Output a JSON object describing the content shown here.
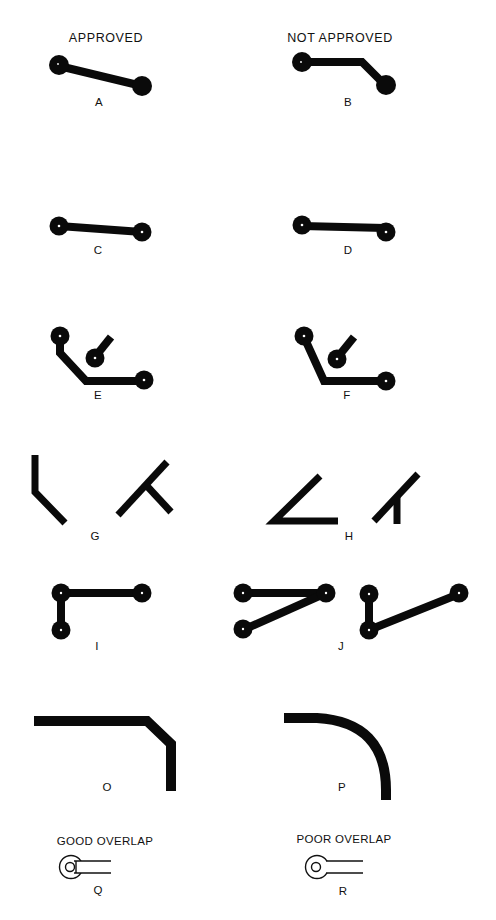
{
  "headers": {
    "left": "APPROVED",
    "right": "NOT APPROVED"
  },
  "figures": [
    {
      "id": "A",
      "label": "A",
      "column": "approved",
      "description": "straight diagonal trace between two pads"
    },
    {
      "id": "B",
      "label": "B",
      "column": "not_approved",
      "description": "trace with unnecessary bend between two pads"
    },
    {
      "id": "C",
      "label": "C",
      "column": "approved",
      "description": "trace centered on pads"
    },
    {
      "id": "D",
      "label": "D",
      "column": "not_approved",
      "description": "trace offset from pad centers"
    },
    {
      "id": "E",
      "label": "E",
      "column": "approved",
      "description": "adequate spacing between trace and pad"
    },
    {
      "id": "F",
      "label": "F",
      "column": "not_approved",
      "description": "insufficient spacing between trace and pad"
    },
    {
      "id": "G",
      "label": "G",
      "column": "approved",
      "description": "obtuse bends and 90 degree tee junctions"
    },
    {
      "id": "H",
      "label": "H",
      "column": "not_approved",
      "description": "acute angle bends and junctions"
    },
    {
      "id": "I",
      "label": "I",
      "column": "approved",
      "description": "traces joining at right angles from pad"
    },
    {
      "id": "J",
      "label": "J",
      "column": "not_approved",
      "description": "traces forming acute angle at pad"
    },
    {
      "id": "O",
      "label": "O",
      "column": "approved",
      "description": "chamfered 45 degree corner"
    },
    {
      "id": "P",
      "label": "P",
      "column": "not_approved",
      "description": "large radius curved corner"
    },
    {
      "id": "Q",
      "label": "Q",
      "column": "approved",
      "caption": "GOOD OVERLAP",
      "description": "trace overlapping pad well"
    },
    {
      "id": "R",
      "label": "R",
      "column": "not_approved",
      "caption": "POOR OVERLAP",
      "description": "trace barely touching pad"
    }
  ],
  "captions": {
    "good_overlap": "GOOD OVERLAP",
    "poor_overlap": "POOR OVERLAP"
  },
  "colors": {
    "ink": "#0a0a0a",
    "background": "#ffffff"
  }
}
